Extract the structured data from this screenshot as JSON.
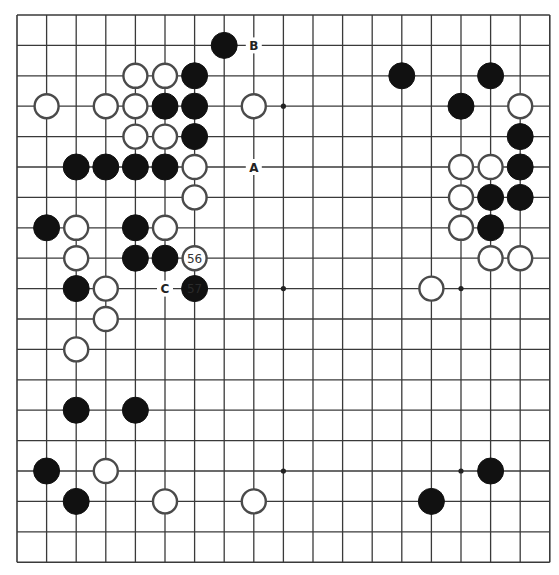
{
  "board": {
    "size": 19,
    "origin_x": 17,
    "origin_y": 15,
    "spacing_x": 29.6,
    "spacing_y": 30.4,
    "stone_radius": 13,
    "colors": {
      "black": "#111111",
      "white": "#ffffff",
      "line": "#3a3a3a"
    }
  },
  "hoshi": [
    [
      3,
      3
    ],
    [
      9,
      3
    ],
    [
      15,
      3
    ],
    [
      3,
      9
    ],
    [
      9,
      9
    ],
    [
      15,
      9
    ],
    [
      3,
      15
    ],
    [
      9,
      15
    ],
    [
      15,
      15
    ]
  ],
  "stones": [
    {
      "color": "black",
      "col": 7,
      "row": 1
    },
    {
      "color": "white",
      "col": 4,
      "row": 2
    },
    {
      "color": "white",
      "col": 5,
      "row": 2
    },
    {
      "color": "black",
      "col": 6,
      "row": 2
    },
    {
      "color": "white",
      "col": 1,
      "row": 3
    },
    {
      "color": "white",
      "col": 3,
      "row": 3
    },
    {
      "color": "white",
      "col": 4,
      "row": 3
    },
    {
      "color": "black",
      "col": 5,
      "row": 3
    },
    {
      "color": "black",
      "col": 6,
      "row": 3
    },
    {
      "color": "white",
      "col": 8,
      "row": 3
    },
    {
      "color": "white",
      "col": 4,
      "row": 4
    },
    {
      "color": "white",
      "col": 5,
      "row": 4
    },
    {
      "color": "black",
      "col": 6,
      "row": 4
    },
    {
      "color": "black",
      "col": 2,
      "row": 5
    },
    {
      "color": "black",
      "col": 3,
      "row": 5
    },
    {
      "color": "black",
      "col": 4,
      "row": 5
    },
    {
      "color": "black",
      "col": 5,
      "row": 5
    },
    {
      "color": "white",
      "col": 6,
      "row": 5
    },
    {
      "color": "white",
      "col": 6,
      "row": 6
    },
    {
      "color": "black",
      "col": 1,
      "row": 7
    },
    {
      "color": "white",
      "col": 2,
      "row": 7
    },
    {
      "color": "black",
      "col": 4,
      "row": 7
    },
    {
      "color": "white",
      "col": 5,
      "row": 7
    },
    {
      "color": "white",
      "col": 2,
      "row": 8
    },
    {
      "color": "black",
      "col": 4,
      "row": 8
    },
    {
      "color": "black",
      "col": 5,
      "row": 8
    },
    {
      "color": "white",
      "col": 6,
      "row": 8,
      "label": "56"
    },
    {
      "color": "black",
      "col": 2,
      "row": 9
    },
    {
      "color": "white",
      "col": 3,
      "row": 9
    },
    {
      "color": "black",
      "col": 6,
      "row": 9,
      "label": "57"
    },
    {
      "color": "white",
      "col": 3,
      "row": 10
    },
    {
      "color": "white",
      "col": 2,
      "row": 11
    },
    {
      "color": "black",
      "col": 2,
      "row": 13
    },
    {
      "color": "black",
      "col": 4,
      "row": 13
    },
    {
      "color": "black",
      "col": 1,
      "row": 15
    },
    {
      "color": "white",
      "col": 3,
      "row": 15
    },
    {
      "color": "black",
      "col": 2,
      "row": 16
    },
    {
      "color": "white",
      "col": 5,
      "row": 16
    },
    {
      "color": "white",
      "col": 8,
      "row": 16
    },
    {
      "color": "black",
      "col": 13,
      "row": 2
    },
    {
      "color": "black",
      "col": 16,
      "row": 2
    },
    {
      "color": "black",
      "col": 15,
      "row": 3
    },
    {
      "color": "white",
      "col": 17,
      "row": 3
    },
    {
      "color": "black",
      "col": 17,
      "row": 4
    },
    {
      "color": "white",
      "col": 15,
      "row": 5
    },
    {
      "color": "white",
      "col": 16,
      "row": 5
    },
    {
      "color": "black",
      "col": 17,
      "row": 5
    },
    {
      "color": "white",
      "col": 15,
      "row": 6
    },
    {
      "color": "black",
      "col": 16,
      "row": 6
    },
    {
      "color": "black",
      "col": 17,
      "row": 6
    },
    {
      "color": "white",
      "col": 15,
      "row": 7
    },
    {
      "color": "black",
      "col": 16,
      "row": 7
    },
    {
      "color": "white",
      "col": 16,
      "row": 8
    },
    {
      "color": "white",
      "col": 17,
      "row": 8
    },
    {
      "color": "white",
      "col": 14,
      "row": 9
    },
    {
      "color": "black",
      "col": 16,
      "row": 15
    },
    {
      "color": "black",
      "col": 14,
      "row": 16
    }
  ],
  "marks": [
    {
      "label": "B",
      "col": 8,
      "row": 1
    },
    {
      "label": "A",
      "col": 8,
      "row": 5
    },
    {
      "label": "C",
      "col": 5,
      "row": 9
    }
  ]
}
